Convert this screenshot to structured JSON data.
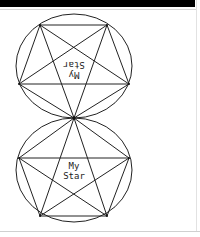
{
  "window": {
    "titlebar_color": "#000000"
  },
  "drawing": {
    "stroke_color": "#222222",
    "upper_star": {
      "label_line1": "My",
      "label_line2": "Star",
      "orientation": "upside-down (mirrored)"
    },
    "lower_star": {
      "label_line1": "My",
      "label_line2": "Star",
      "orientation": "upright"
    }
  }
}
